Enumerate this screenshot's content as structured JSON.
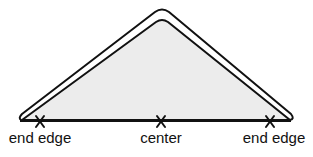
{
  "diagram": {
    "shape": "triangle",
    "fill_color": "#ececec",
    "stroke_color": "#111111",
    "markers": [
      {
        "id": "left-end-edge",
        "symbol": "X",
        "label": "end edge",
        "x": 40
      },
      {
        "id": "center",
        "symbol": "X",
        "label": "center",
        "x": 161
      },
      {
        "id": "right-end-edge",
        "symbol": "X",
        "label": "end edge",
        "x": 270
      }
    ]
  }
}
